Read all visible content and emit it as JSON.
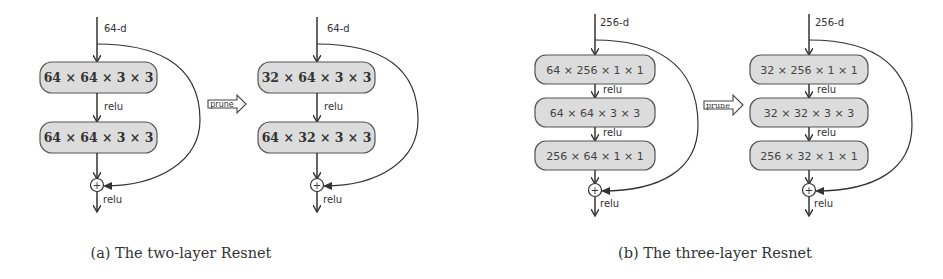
{
  "figure": {
    "panel_a": {
      "caption": "(a) The two-layer Resnet",
      "original": {
        "input_label": "64-d",
        "layers": [
          "64 × 64 × 3 × 3",
          "64 × 64 × 3 × 3"
        ],
        "activations": [
          "relu"
        ],
        "output_activation": "relu",
        "sum_symbol": "+"
      },
      "prune_label": "prune",
      "pruned": {
        "input_label": "64-d",
        "layers": [
          "32 × 64 × 3 × 3",
          "64 × 32 × 3 × 3"
        ],
        "activations": [
          "relu"
        ],
        "output_activation": "relu",
        "sum_symbol": "+"
      }
    },
    "panel_b": {
      "caption": "(b) The three-layer Resnet",
      "original": {
        "input_label": "256-d",
        "layers": [
          "64 × 256 × 1 × 1",
          "64 × 64 × 3 × 3",
          "256 × 64 × 1 × 1"
        ],
        "activations": [
          "relu",
          "relu"
        ],
        "output_activation": "relu",
        "sum_symbol": "+"
      },
      "prune_label": "prune",
      "pruned": {
        "input_label": "256-d",
        "layers": [
          "32 × 256 × 1 × 1",
          "32 × 32 × 3 × 3",
          "256 × 32 × 1 × 1"
        ],
        "activations": [
          "relu",
          "relu"
        ],
        "output_activation": "relu",
        "sum_symbol": "+"
      }
    }
  }
}
